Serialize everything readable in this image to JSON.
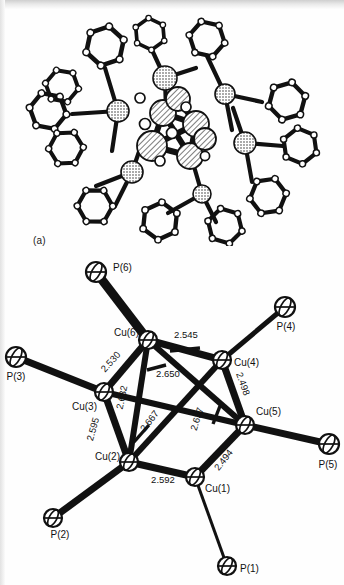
{
  "figure": {
    "panels": [
      {
        "tag": "(a)",
        "name": "full-cluster-ortep",
        "description": "ORTEP drawing of complete cluster with triphenylphosphine ligands"
      },
      {
        "tag": "(b)",
        "name": "core-skeleton",
        "description": "Cu6P6 core skeleton with Cu-Cu bond distances in angstroms"
      }
    ],
    "core": {
      "atoms": [
        {
          "label": "Cu(1)",
          "element": "Cu",
          "x": 195,
          "y": 477,
          "lx": 205,
          "ly": 492,
          "anchor": "start",
          "r": 9
        },
        {
          "label": "Cu(2)",
          "element": "Cu",
          "x": 129,
          "y": 462,
          "lx": 120,
          "ly": 460,
          "anchor": "end",
          "r": 9
        },
        {
          "label": "Cu(3)",
          "element": "Cu",
          "x": 104,
          "y": 392,
          "lx": 97,
          "ly": 410,
          "anchor": "end",
          "r": 9
        },
        {
          "label": "Cu(4)",
          "element": "Cu",
          "x": 222,
          "y": 360,
          "lx": 234,
          "ly": 366,
          "anchor": "start",
          "r": 9
        },
        {
          "label": "Cu(5)",
          "element": "Cu",
          "x": 245,
          "y": 425,
          "lx": 256,
          "ly": 415,
          "anchor": "start",
          "r": 9
        },
        {
          "label": "Cu(6)",
          "element": "Cu",
          "x": 148,
          "y": 340,
          "lx": 139,
          "ly": 336,
          "anchor": "end",
          "r": 9
        },
        {
          "label": "P(1)",
          "element": "P",
          "x": 227,
          "y": 566,
          "lx": 240,
          "ly": 572,
          "anchor": "start",
          "r": 9
        },
        {
          "label": "P(2)",
          "element": "P",
          "x": 53,
          "y": 518,
          "lx": 60,
          "ly": 538,
          "anchor": "middle",
          "r": 9
        },
        {
          "label": "P(3)",
          "element": "P",
          "x": 16,
          "y": 357,
          "lx": 16,
          "ly": 380,
          "anchor": "middle",
          "r": 10
        },
        {
          "label": "P(4)",
          "element": "P",
          "x": 285,
          "y": 307,
          "lx": 286,
          "ly": 330,
          "anchor": "middle",
          "r": 10
        },
        {
          "label": "P(5)",
          "element": "P",
          "x": 329,
          "y": 444,
          "lx": 328,
          "ly": 468,
          "anchor": "middle",
          "r": 10
        },
        {
          "label": "P(6)",
          "element": "P",
          "x": 96,
          "y": 272,
          "lx": 113,
          "ly": 271,
          "anchor": "start",
          "r": 10
        }
      ],
      "cu_p_bonds": [
        {
          "from": "Cu(1)",
          "to": "P(1)",
          "x1": 195,
          "y1": 477,
          "x2": 227,
          "y2": 566,
          "w": 3
        },
        {
          "from": "Cu(2)",
          "to": "P(2)",
          "x1": 129,
          "y1": 462,
          "x2": 53,
          "y2": 518,
          "w": 7
        },
        {
          "from": "Cu(3)",
          "to": "P(3)",
          "x1": 104,
          "y1": 392,
          "x2": 16,
          "y2": 357,
          "w": 7
        },
        {
          "from": "Cu(4)",
          "to": "P(4)",
          "x1": 222,
          "y1": 360,
          "x2": 285,
          "y2": 307,
          "w": 5
        },
        {
          "from": "Cu(5)",
          "to": "P(5)",
          "x1": 245,
          "y1": 425,
          "x2": 329,
          "y2": 444,
          "w": 7
        },
        {
          "from": "Cu(6)",
          "to": "P(6)",
          "x1": 148,
          "y1": 340,
          "x2": 96,
          "y2": 272,
          "w": 9
        }
      ],
      "cu_cu_bonds": [
        {
          "from": "Cu(6)",
          "to": "Cu(4)",
          "distance": "2.545",
          "x1": 148,
          "y1": 340,
          "x2": 222,
          "y2": 360,
          "w": 7,
          "lx": 186,
          "ly": 338,
          "rot": 0,
          "tick": {
            "x1": 170,
            "y1": 351,
            "x2": 200,
            "y2": 348
          }
        },
        {
          "from": "Cu(6)",
          "to": "Cu(3)",
          "distance": "2.530",
          "x1": 148,
          "y1": 340,
          "x2": 104,
          "y2": 392,
          "w": 7,
          "lx": 113,
          "ly": 364,
          "rot": -48,
          "tick": null
        },
        {
          "from": "Cu(3)",
          "to": "Cu(2)",
          "distance": "2.595",
          "x1": 104,
          "y1": 392,
          "x2": 129,
          "y2": 462,
          "w": 7,
          "lx": 96,
          "ly": 430,
          "rot": -74,
          "tick": null
        },
        {
          "from": "Cu(2)",
          "to": "Cu(1)",
          "distance": "2.592",
          "x1": 129,
          "y1": 462,
          "x2": 195,
          "y2": 477,
          "w": 7,
          "lx": 163,
          "ly": 483,
          "rot": 0,
          "tick": null
        },
        {
          "from": "Cu(1)",
          "to": "Cu(5)",
          "distance": "2.494",
          "x1": 195,
          "y1": 477,
          "x2": 245,
          "y2": 425,
          "w": 7,
          "lx": 226,
          "ly": 462,
          "rot": -52,
          "tick": null
        },
        {
          "from": "Cu(5)",
          "to": "Cu(4)",
          "distance": "2.498",
          "x1": 245,
          "y1": 425,
          "x2": 222,
          "y2": 360,
          "w": 7,
          "lx": 240,
          "ly": 385,
          "rot": 70,
          "tick": null
        },
        {
          "from": "Cu(6)",
          "to": "Cu(2)",
          "distance": "2.632",
          "x1": 148,
          "y1": 340,
          "x2": 129,
          "y2": 462,
          "w": 6,
          "lx": 125,
          "ly": 398,
          "rot": -78,
          "tick": null
        },
        {
          "from": "Cu(6)",
          "to": "Cu(5)",
          "distance": "2.650",
          "x1": 148,
          "y1": 340,
          "x2": 245,
          "y2": 425,
          "w": 6,
          "lx": 168,
          "ly": 377,
          "rot": 0,
          "tick": {
            "x1": 147,
            "y1": 370,
            "x2": 166,
            "y2": 365
          }
        },
        {
          "from": "Cu(2)",
          "to": "Cu(4)",
          "distance": "2.667",
          "x1": 129,
          "y1": 462,
          "x2": 222,
          "y2": 360,
          "w": 6,
          "lx": 152,
          "ly": 423,
          "rot": -52,
          "tick": {
            "x1": 134,
            "y1": 442,
            "x2": 149,
            "y2": 425
          }
        },
        {
          "from": "Cu(5)",
          "to": "Cu(3)",
          "distance": "2.637",
          "x1": 245,
          "y1": 425,
          "x2": 104,
          "y2": 392,
          "w": 6,
          "lx": 200,
          "ly": 420,
          "rot": -73,
          "tick": {
            "x1": 213,
            "y1": 424,
            "x2": 220,
            "y2": 406
          }
        }
      ]
    }
  }
}
